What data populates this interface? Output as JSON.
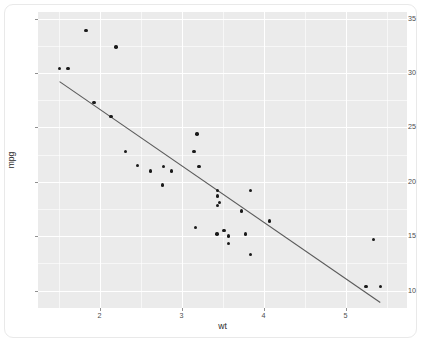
{
  "chart": {
    "type": "scatter",
    "title": "",
    "xlabel": "wt",
    "ylabel": "mpg"
  },
  "axes": {
    "x_ticks": [
      "2",
      "3",
      "4",
      "5"
    ],
    "y_ticks": [
      "35",
      "30",
      "25",
      "20",
      "15",
      "10"
    ]
  },
  "style": {
    "panel_background": "#ebebeb",
    "grid_color": "#ffffff",
    "point_color": "#1a1a1a",
    "line_color": "#5a5a5a",
    "text_color": "#4d4d4d"
  },
  "chart_data": {
    "type": "scatter",
    "title": "",
    "xlabel": "wt",
    "ylabel": "mpg",
    "xlim": [
      1.25,
      5.75
    ],
    "ylim": [
      8.4,
      35.6
    ],
    "x_ticks": [
      2,
      3,
      4,
      5
    ],
    "y_ticks": [
      10,
      15,
      20,
      25,
      30,
      35
    ],
    "x_minor_ticks": [
      1.5,
      2.5,
      3.5,
      4.5,
      5.5
    ],
    "y_minor_ticks": [
      12.5,
      17.5,
      22.5,
      27.5,
      32.5
    ],
    "grid": true,
    "legend": "none",
    "series": [
      {
        "name": "mtcars",
        "marker": "filled-circle",
        "x": [
          2.62,
          2.875,
          2.32,
          3.215,
          3.44,
          3.46,
          3.57,
          3.19,
          3.15,
          3.44,
          3.44,
          4.07,
          3.73,
          3.78,
          5.25,
          5.424,
          5.345,
          2.2,
          1.615,
          1.835,
          2.465,
          3.52,
          3.435,
          3.84,
          3.845,
          1.935,
          2.14,
          1.513,
          3.17,
          2.77,
          3.57,
          2.78
        ],
        "y": [
          21.0,
          21.0,
          22.8,
          21.4,
          18.7,
          18.1,
          14.3,
          24.4,
          22.8,
          19.2,
          17.8,
          16.4,
          17.3,
          15.2,
          10.4,
          10.4,
          14.7,
          32.4,
          30.4,
          33.9,
          21.5,
          15.5,
          15.2,
          13.3,
          19.2,
          27.3,
          26.0,
          30.4,
          15.8,
          19.7,
          15.0,
          21.4
        ]
      }
    ],
    "annotations": [
      {
        "type": "regression-line",
        "x0": 1.513,
        "y0": 29.2,
        "x1": 5.424,
        "y1": 8.9,
        "color": "#5a5a5a"
      }
    ]
  }
}
